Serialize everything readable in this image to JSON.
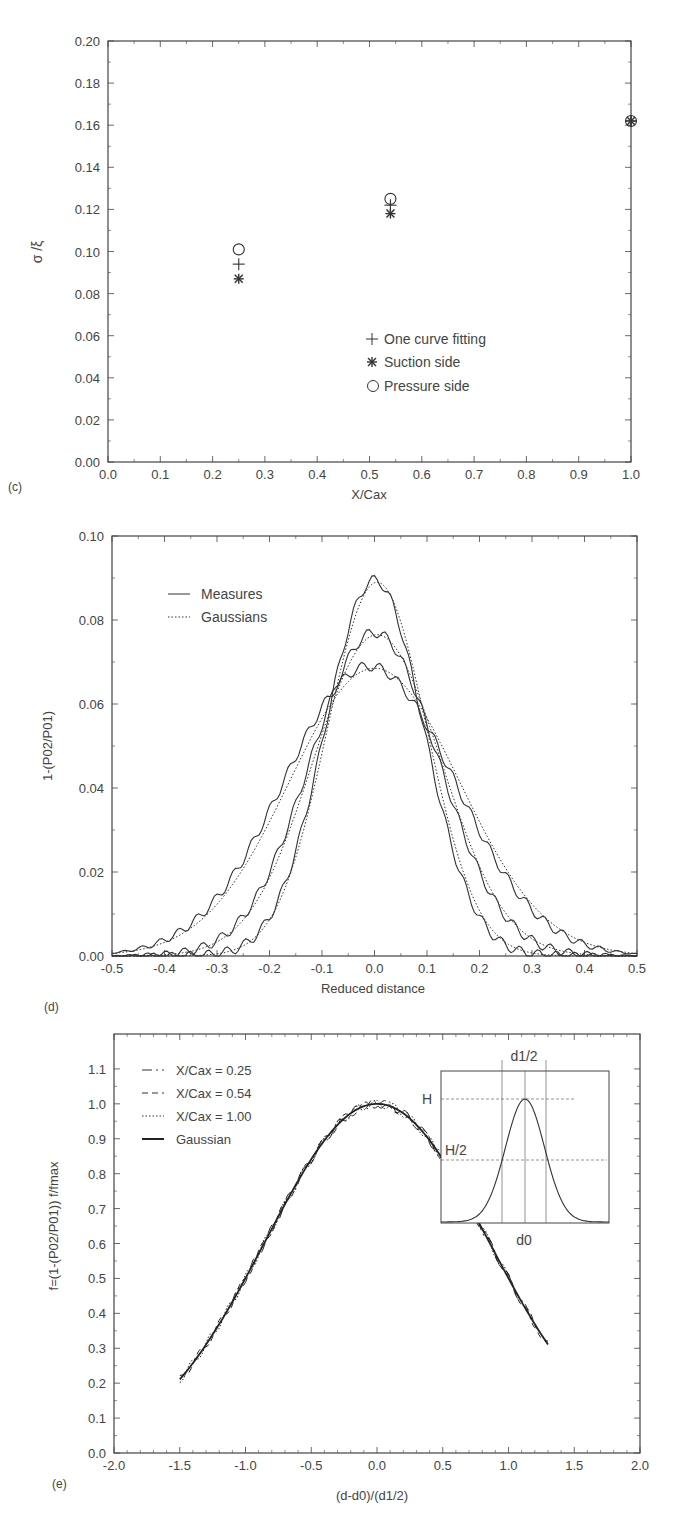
{
  "chart_data": [
    {
      "panel": "(c)",
      "type": "scatter",
      "title": "",
      "xlabel": "X/Cax",
      "ylabel": "σ /ξ",
      "xlim": [
        0.0,
        1.0
      ],
      "ylim": [
        0.0,
        0.2
      ],
      "xticks": [
        "0.0",
        "0.1",
        "0.2",
        "0.3",
        "0.4",
        "0.5",
        "0.6",
        "0.7",
        "0.8",
        "0.9",
        "1.0"
      ],
      "yticks": [
        "0.00",
        "0.02",
        "0.04",
        "0.06",
        "0.08",
        "0.10",
        "0.12",
        "0.14",
        "0.16",
        "0.18",
        "0.20"
      ],
      "grid": false,
      "legend_position": "inside-center-right",
      "x": [
        0.25,
        0.54,
        1.0
      ],
      "series": [
        {
          "name": "One curve fitting",
          "marker": "plus",
          "values": [
            0.094,
            0.122,
            0.162
          ]
        },
        {
          "name": "Suction side",
          "marker": "asterisk",
          "values": [
            0.087,
            0.118,
            0.162
          ]
        },
        {
          "name": "Pressure side",
          "marker": "circle",
          "values": [
            0.101,
            0.125,
            0.162
          ]
        }
      ]
    },
    {
      "panel": "(d)",
      "type": "line",
      "title": "",
      "xlabel": "Reduced distance",
      "ylabel": "1-(P02/P01)",
      "xlim": [
        -0.5,
        0.5
      ],
      "ylim": [
        0.0,
        0.1
      ],
      "xticks": [
        "-0.5",
        "-0.4",
        "-0.3",
        "-0.2",
        "-0.1",
        "0.0",
        "0.1",
        "0.2",
        "0.3",
        "0.4",
        "0.5"
      ],
      "yticks": [
        "0.00",
        "0.02",
        "0.04",
        "0.06",
        "0.08",
        "0.10"
      ],
      "grid": false,
      "legend_position": "upper-left",
      "legend": [
        {
          "name": "Measures",
          "style": "solid"
        },
        {
          "name": "Gaussians",
          "style": "dotted"
        }
      ],
      "series": [
        {
          "name": "Measures X/Cax=0.25",
          "style": "solid",
          "peak": 0.0895,
          "center": 0.0,
          "sigma": 0.094
        },
        {
          "name": "Gaussian X/Cax=0.25",
          "style": "dotted",
          "peak": 0.089,
          "center": 0.005,
          "sigma": 0.095
        },
        {
          "name": "Measures X/Cax=0.54",
          "style": "solid",
          "peak": 0.077,
          "center": 0.0,
          "sigma": 0.122
        },
        {
          "name": "Gaussian X/Cax=0.54",
          "style": "dotted",
          "peak": 0.0765,
          "center": 0.005,
          "sigma": 0.122
        },
        {
          "name": "Measures X/Cax=1.00",
          "style": "solid",
          "peak": 0.069,
          "center": -0.01,
          "sigma": 0.162
        },
        {
          "name": "Gaussian X/Cax=1.00",
          "style": "dotted",
          "peak": 0.0685,
          "center": 0.0,
          "sigma": 0.162
        }
      ]
    },
    {
      "panel": "(e)",
      "type": "line",
      "title": "",
      "xlabel": "(d-d0)/(d1/2)",
      "ylabel": "f=(1-(P02/P01))   f/fmax",
      "xlim": [
        -2.0,
        2.0
      ],
      "ylim": [
        0.0,
        1.2
      ],
      "xticks": [
        "-2.0",
        "-1.5",
        "-1.0",
        "-0.5",
        "0.0",
        "0.5",
        "1.0",
        "1.5",
        "2.0"
      ],
      "yticks": [
        "0.0",
        "0.1",
        "0.2",
        "0.3",
        "0.4",
        "0.5",
        "0.6",
        "0.7",
        "0.8",
        "0.9",
        "1.0",
        "1.1"
      ],
      "grid": false,
      "legend_position": "upper-left",
      "series": [
        {
          "name": "X/Cax = 0.25",
          "style": "dash-dot",
          "x_range": [
            -1.1,
            1.2
          ]
        },
        {
          "name": "X/Cax = 0.54",
          "style": "dashed",
          "x_range": [
            -1.5,
            1.3
          ]
        },
        {
          "name": "X/Cax = 1.00",
          "style": "dotted",
          "x_range": [
            -1.5,
            1.0
          ]
        },
        {
          "name": "Gaussian",
          "style": "solid-bold",
          "x_range": [
            -1.5,
            1.3
          ],
          "peak": 1.0
        }
      ],
      "inset": {
        "description": "Gaussian schematic",
        "labels": {
          "top": "d1/2",
          "bottom": "d0",
          "height": "H",
          "half_height": "H/2"
        }
      }
    }
  ],
  "panels": {
    "c": {
      "tag": "(c)",
      "xlabel": "X/Cax",
      "ylabel": "σ /ξ",
      "legend": [
        "One curve fitting",
        "Suction side",
        "Pressure side"
      ]
    },
    "d": {
      "tag": "(d)",
      "xlabel": "Reduced distance",
      "ylabel": "1-(P02/P01)",
      "legend": [
        "Measures",
        "Gaussians"
      ]
    },
    "e": {
      "tag": "(e)",
      "xlabel": "(d-d0)/(d1/2)",
      "ylabel": "f=(1-(P02/P01))   f/fmax",
      "legend": [
        "X/Cax = 0.25",
        "X/Cax = 0.54",
        "X/Cax = 1.00",
        "Gaussian"
      ],
      "inset": {
        "top": "d1/2",
        "bottom": "d0",
        "h": "H",
        "h2": "H/2"
      }
    }
  },
  "colors": {
    "ink": "#333333",
    "axis": "#444444",
    "background": "#ffffff"
  }
}
